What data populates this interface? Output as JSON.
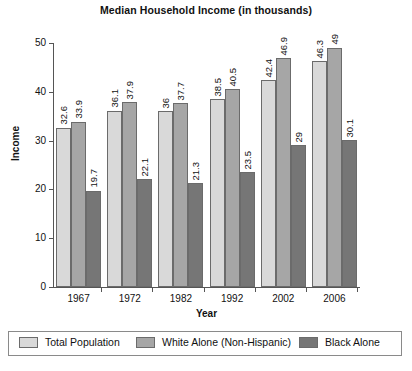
{
  "chart_data": {
    "type": "bar",
    "title": "Median Household Income (in thousands)",
    "xlabel": "Year",
    "ylabel": "Income",
    "categories": [
      "1967",
      "1972",
      "1982",
      "1992",
      "2002",
      "2006"
    ],
    "ylim": [
      0,
      50
    ],
    "yticks": [
      "0",
      "10",
      "20",
      "30",
      "40",
      "50"
    ],
    "grid": false,
    "legend_position": "bottom",
    "series": [
      {
        "name": "Total Population",
        "color": "#d9d9d9",
        "values": [
          32.6,
          36.1,
          36,
          38.5,
          42.4,
          46.3
        ],
        "labels": [
          "32.6",
          "36.1",
          "36",
          "38.5",
          "42.4",
          "46.3"
        ]
      },
      {
        "name": "White Alone (Non-Hispanic)",
        "color": "#a6a6a6",
        "values": [
          33.9,
          37.9,
          37.7,
          40.5,
          46.9,
          49
        ],
        "labels": [
          "33.9",
          "37.9",
          "37.7",
          "40.5",
          "46.9",
          "49"
        ]
      },
      {
        "name": "Black Alone",
        "color": "#767676",
        "values": [
          19.7,
          22.1,
          21.3,
          23.5,
          29,
          30.1
        ],
        "labels": [
          "19.7",
          "22.1",
          "21.3",
          "23.5",
          "29",
          "30.1"
        ]
      }
    ]
  }
}
